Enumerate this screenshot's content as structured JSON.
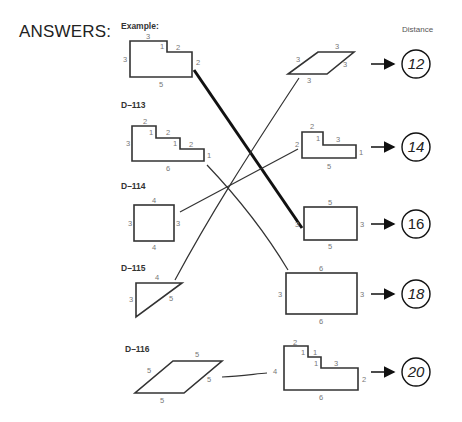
{
  "title": "ANSWERS:",
  "distance_header": "Distance",
  "labels": {
    "example": "Example:",
    "d113": "D–113",
    "d114": "D–114",
    "d115": "D–115",
    "d116": "D–116"
  },
  "left_shapes": [
    {
      "id": "example",
      "type": "L-shape",
      "sides": [
        "3",
        "1",
        "2",
        "2",
        "5",
        "3"
      ],
      "matches_distance": "16"
    },
    {
      "id": "D-113",
      "type": "staircase",
      "sides": [
        "2",
        "1",
        "2",
        "1",
        "2",
        "1",
        "6",
        "3"
      ],
      "matches_distance": "18"
    },
    {
      "id": "D-114",
      "type": "rectangle",
      "sides": [
        "4",
        "3",
        "4",
        "3"
      ],
      "matches_distance": "14"
    },
    {
      "id": "D-115",
      "type": "right-triangle",
      "sides": [
        "4",
        "5",
        "3"
      ],
      "matches_distance": "12"
    },
    {
      "id": "D-116",
      "type": "rhombus",
      "sides": [
        "5",
        "5",
        "5",
        "5"
      ],
      "matches_distance": "20"
    }
  ],
  "right_shapes": [
    {
      "type": "rhombus",
      "sides": [
        "3",
        "3",
        "3",
        "3"
      ],
      "distance": "12"
    },
    {
      "type": "L-shape",
      "sides": [
        "2",
        "1",
        "3",
        "1",
        "5",
        "2"
      ],
      "distance": "14"
    },
    {
      "type": "rectangle",
      "sides": [
        "5",
        "3",
        "5",
        "3"
      ],
      "distance": "16"
    },
    {
      "type": "rectangle",
      "sides": [
        "6",
        "3",
        "6",
        "3"
      ],
      "distance": "18"
    },
    {
      "type": "staircase",
      "sides": [
        "2",
        "1",
        "1",
        "1",
        "3",
        "2",
        "6",
        "4"
      ],
      "distance": "20"
    }
  ],
  "distances": [
    "12",
    "14",
    "16",
    "18",
    "20"
  ]
}
